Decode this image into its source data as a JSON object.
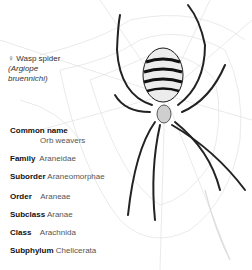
{
  "caption": {
    "sex_symbol": "♀",
    "common": "Wasp spider",
    "scientific_line1": "(Argiope",
    "scientific_line2": "bruennichi)"
  },
  "taxonomy": [
    {
      "key": "Common name",
      "value": "Orb weavers"
    },
    {
      "key": "Family",
      "value": "Araneidae"
    },
    {
      "key": "Suborder",
      "value": "Araneomorphae"
    },
    {
      "key": "Order",
      "value": "Araneae"
    },
    {
      "key": "Subclass",
      "value": "Aranae"
    },
    {
      "key": "Class",
      "value": "Arachnida"
    },
    {
      "key": "Subphylum",
      "value": "Chelicerata"
    }
  ],
  "illustration": {
    "subject": "wasp-spider-on-web",
    "colors": {
      "ink": "#1a1a1a",
      "web": "#d8d8d8",
      "abdomen": "#e8e8e8"
    }
  }
}
